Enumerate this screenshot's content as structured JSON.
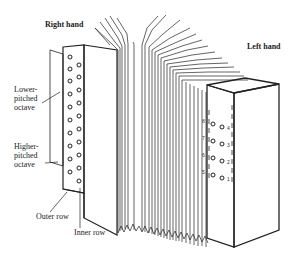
{
  "diagram": {
    "labels": {
      "right_hand": "Right hand",
      "left_hand": "Left hand",
      "lower_octave": "Lower-\npitched\noctave",
      "lower_octave_lines": [
        "Lower-",
        "pitched",
        "octave"
      ],
      "higher_octave_lines": [
        "Higher-",
        "pitched",
        "octave"
      ],
      "outer_row": "Outer row",
      "inner_row": "Inner row"
    },
    "left_hand_buttons": {
      "outer_numbers": [
        "8",
        "7",
        "6",
        "5"
      ],
      "inner_numbers": [
        "4",
        "3",
        "2",
        "1"
      ]
    },
    "right_hand_buttons": {
      "outer_row_count": 10,
      "inner_row_count": 10
    },
    "colors": {
      "stroke": "#222222",
      "background": "#ffffff"
    }
  }
}
